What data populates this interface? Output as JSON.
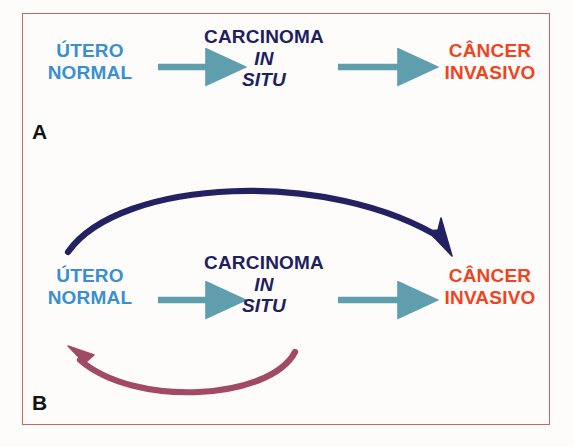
{
  "figure": {
    "background_color": "#fdfcfa",
    "frame_color": "#c8645c"
  },
  "colors": {
    "normal_blue": "#3a8fd0",
    "carcinoma_navy": "#1d2160",
    "invasive_red": "#f0441f",
    "teal_arrow": "#5f9ead",
    "navy_curve": "#242163",
    "maroon_curve": "#a14a63",
    "panel_letter": "#131313"
  },
  "panels": [
    {
      "id": "A",
      "letter": "A",
      "nodes": {
        "normal": {
          "line1": "ÚTERO",
          "line2": "NORMAL"
        },
        "carcinoma": {
          "line1": "CARCINOMA",
          "line2": "IN",
          "line3": "SITU"
        },
        "invasive": {
          "line1": "CÂNCER",
          "line2": "INVASIVO"
        }
      },
      "arrows": [
        {
          "name": "arrow-normal-to-cis",
          "style": "straight",
          "color": "#5f9ead"
        },
        {
          "name": "arrow-cis-to-invasive",
          "style": "straight",
          "color": "#5f9ead"
        }
      ]
    },
    {
      "id": "B",
      "letter": "B",
      "nodes": {
        "normal": {
          "line1": "ÚTERO",
          "line2": "NORMAL"
        },
        "carcinoma": {
          "line1": "CARCINOMA",
          "line2": "IN",
          "line3": "SITU"
        },
        "invasive": {
          "line1": "CÂNCER",
          "line2": "INVASIVO"
        }
      },
      "arrows": [
        {
          "name": "arrow-normal-to-cis",
          "style": "straight",
          "color": "#5f9ead"
        },
        {
          "name": "arrow-cis-to-invasive",
          "style": "straight",
          "color": "#5f9ead"
        },
        {
          "name": "arrow-normal-to-invasive-curve",
          "style": "curved-top",
          "color": "#242163"
        },
        {
          "name": "arrow-cis-to-normal-regression-curve",
          "style": "curved-bottom",
          "color": "#a14a63"
        }
      ]
    }
  ]
}
